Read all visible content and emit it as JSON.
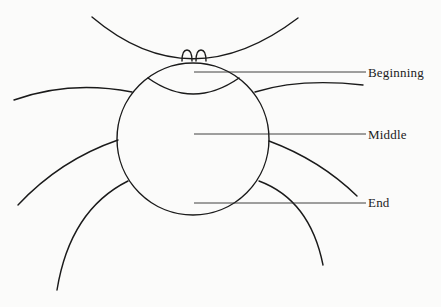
{
  "diagram": {
    "type": "labeled-illustration",
    "labels": [
      {
        "text": "Beginning",
        "x": 368,
        "y": 66
      },
      {
        "text": "Middle",
        "x": 368,
        "y": 128
      },
      {
        "text": "End",
        "x": 368,
        "y": 196
      }
    ],
    "colors": {
      "ink": "#1a1a1a",
      "paper": "#fbfbfa"
    }
  }
}
